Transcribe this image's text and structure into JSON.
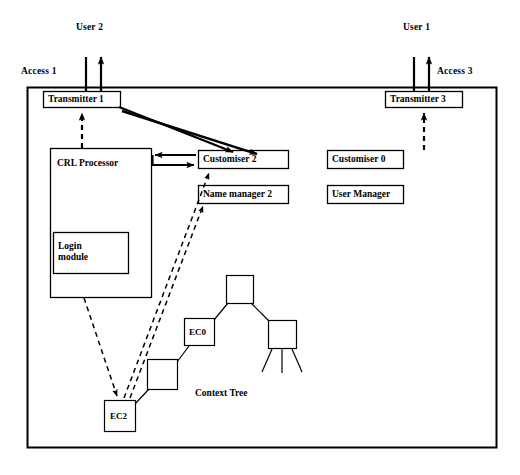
{
  "diagram": {
    "title_text": "Context Tree",
    "outer_frame": {
      "name": "system-boundary"
    },
    "external_actors": [
      {
        "id": "user2",
        "label": "User 2"
      },
      {
        "id": "user1",
        "label": "User 1"
      }
    ],
    "access_points": [
      {
        "id": "access1",
        "label": "Access 1"
      },
      {
        "id": "access3",
        "label": "Access 3"
      }
    ],
    "boxes": [
      {
        "id": "transmitter1",
        "label": "Transmitter 1"
      },
      {
        "id": "transmitter3",
        "label": "Transmitter 3"
      },
      {
        "id": "crl_processor",
        "label": "CRL Processor"
      },
      {
        "id": "login_module",
        "label": "Login\nmodule"
      },
      {
        "id": "customiser2",
        "label": "Customiser 2"
      },
      {
        "id": "name_manager2",
        "label": "Name manager 2"
      },
      {
        "id": "customiser0",
        "label": "Customiser 0"
      },
      {
        "id": "user_manager",
        "label": "User Manager"
      }
    ],
    "tree": {
      "caption": "Context Tree",
      "nodes": [
        {
          "id": "ec2",
          "label": "EC2"
        },
        {
          "id": "node_mid",
          "label": ""
        },
        {
          "id": "ec0",
          "label": "EC0"
        },
        {
          "id": "node_root",
          "label": ""
        },
        {
          "id": "node_right",
          "label": ""
        }
      ]
    },
    "colors": {
      "stroke": "#000000",
      "background": "#ffffff"
    }
  }
}
